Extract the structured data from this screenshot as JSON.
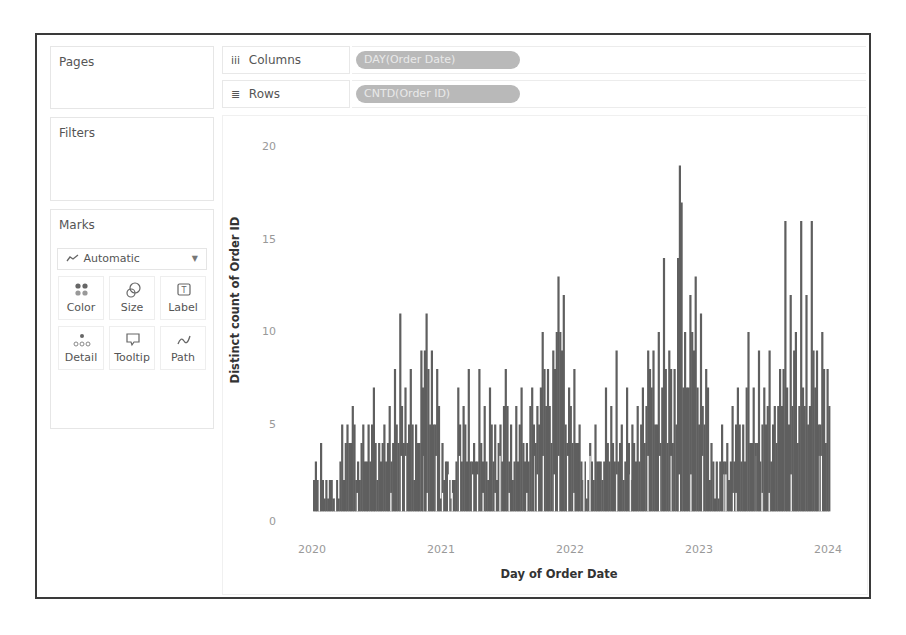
{
  "cards": {
    "pages": {
      "title": "Pages"
    },
    "filters": {
      "title": "Filters"
    },
    "marks": {
      "title": "Marks",
      "mark_type": "Automatic",
      "buttons": [
        {
          "label": "Color",
          "icon": "color-icon"
        },
        {
          "label": "Size",
          "icon": "size-icon"
        },
        {
          "label": "Label",
          "icon": "label-icon"
        },
        {
          "label": "Detail",
          "icon": "detail-icon"
        },
        {
          "label": "Tooltip",
          "icon": "tooltip-icon"
        },
        {
          "label": "Path",
          "icon": "path-icon"
        }
      ]
    }
  },
  "shelves": {
    "columns": {
      "label": "Columns",
      "glyph": "iii",
      "pill": "DAY(Order Date)"
    },
    "rows": {
      "label": "Rows",
      "glyph": "≣",
      "pill": "CNTD(Order ID)"
    }
  },
  "colors": {
    "bar": "#5f5f5f",
    "pill_bg": "#b9b9b9",
    "pill_text": "#e9e9e9",
    "frame": "#3a3a3a"
  },
  "chart_data": {
    "type": "bar",
    "title": "",
    "xlabel": "Day of Order Date",
    "ylabel": "Distinct count of Order ID",
    "ylim": [
      0,
      20
    ],
    "yticks": [
      "0",
      "5",
      "10",
      "15",
      "20"
    ],
    "xticks": [
      "2020",
      "2021",
      "2022",
      "2023",
      "2024"
    ],
    "xlim": [
      "2020-01-01",
      "2024-01-01"
    ],
    "grid": false,
    "legend": "none",
    "x_resolution": "half-month",
    "series": [
      {
        "name": "CNTD(Order ID)",
        "envelope_peaks": [
          3,
          4,
          2,
          2,
          2,
          5,
          5,
          6,
          3,
          5,
          5,
          7,
          4,
          5,
          6,
          8,
          11,
          7,
          8,
          5,
          9,
          11,
          9,
          8,
          4,
          3,
          2,
          7,
          6,
          8,
          4,
          8,
          6,
          7,
          5,
          5,
          8,
          5,
          6,
          7,
          4,
          7,
          6,
          10,
          8,
          9,
          13,
          12,
          7,
          8,
          5,
          3,
          4,
          5,
          3,
          7,
          6,
          9,
          5,
          7,
          5,
          6,
          7,
          9,
          9,
          10,
          14,
          9,
          8,
          19,
          10,
          12,
          13,
          11,
          8,
          4,
          3,
          5,
          4,
          6,
          7,
          5,
          10,
          7,
          9,
          7,
          9,
          6,
          8,
          16,
          12,
          10,
          16,
          12,
          16,
          9,
          10,
          8
        ]
      }
    ]
  }
}
